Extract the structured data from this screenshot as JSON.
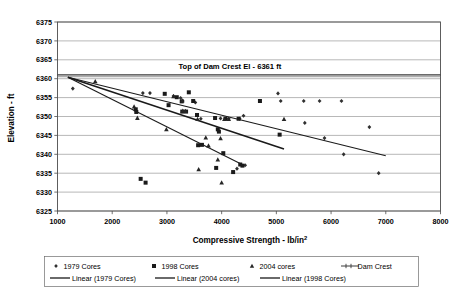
{
  "chart_data": {
    "type": "scatter",
    "title": "",
    "xlabel": "Compressive Strength - lb/in²",
    "ylabel": "Elevation - ft",
    "xlim": [
      1000,
      8000
    ],
    "ylim": [
      6325,
      6375
    ],
    "xticks": [
      1000,
      2000,
      3000,
      4000,
      5000,
      6000,
      7000,
      8000
    ],
    "yticks": [
      6325,
      6330,
      6335,
      6340,
      6345,
      6350,
      6355,
      6360,
      6365,
      6370,
      6375
    ],
    "xtick_labels": [
      "1000",
      "2000",
      "3000",
      "4000",
      "5000",
      "6000",
      "7000",
      "8000"
    ],
    "ytick_labels": [
      "6325",
      "6330",
      "6335",
      "6340",
      "6345",
      "6350",
      "6355",
      "6360",
      "6365",
      "6370",
      "6375"
    ],
    "grid": true,
    "grid_axis": "y",
    "legend_position": "bottom",
    "annotations": [
      {
        "name": "dam-crest-annotation",
        "text": "Top of Dam Crest El - 6361 ft",
        "x": 4150,
        "y": 6362.6
      }
    ],
    "series": [
      {
        "name": "1979 Cores",
        "marker": "diamond",
        "color": "#303030",
        "points": [
          [
            1280,
            6357.4
          ],
          [
            2560,
            6356.2
          ],
          [
            2690,
            6356.2
          ],
          [
            3120,
            6355.4
          ],
          [
            3250,
            6354.9
          ],
          [
            3290,
            6354.1
          ],
          [
            3520,
            6353.7
          ],
          [
            3620,
            6349.4
          ],
          [
            3980,
            6349.5
          ],
          [
            4080,
            6349.4
          ],
          [
            4130,
            6349.4
          ],
          [
            4330,
            6349.4
          ],
          [
            4400,
            6350.2
          ],
          [
            4280,
            6336.2
          ],
          [
            4430,
            6337.1
          ],
          [
            5030,
            6356.1
          ],
          [
            5080,
            6354.1
          ],
          [
            5500,
            6354.1
          ],
          [
            5520,
            6348.3
          ],
          [
            5790,
            6354.1
          ],
          [
            5880,
            6344.3
          ],
          [
            6190,
            6354.1
          ],
          [
            6230,
            6340.0
          ],
          [
            6700,
            6347.2
          ],
          [
            6870,
            6335.0
          ]
        ]
      },
      {
        "name": "1998 Cores",
        "marker": "square",
        "color": "#1a1a1a",
        "points": [
          [
            2430,
            6351.9
          ],
          [
            2440,
            6351.2
          ],
          [
            2520,
            6333.5
          ],
          [
            2610,
            6332.5
          ],
          [
            2960,
            6356.0
          ],
          [
            3030,
            6353.0
          ],
          [
            3180,
            6355.1
          ],
          [
            3270,
            6354.0
          ],
          [
            3280,
            6351.3
          ],
          [
            3350,
            6351.3
          ],
          [
            3400,
            6356.4
          ],
          [
            3480,
            6354.1
          ],
          [
            3550,
            6350.4
          ],
          [
            3570,
            6342.4
          ],
          [
            3640,
            6342.5
          ],
          [
            3880,
            6349.6
          ],
          [
            3900,
            6336.4
          ],
          [
            3930,
            6346.6
          ],
          [
            3950,
            6346.0
          ],
          [
            4030,
            6340.3
          ],
          [
            4070,
            6349.4
          ],
          [
            4210,
            6335.3
          ],
          [
            4310,
            6349.4
          ],
          [
            4340,
            6337.3
          ],
          [
            4380,
            6337.0
          ],
          [
            4700,
            6354.1
          ],
          [
            5060,
            6345.2
          ]
        ]
      },
      {
        "name": "2004 cores",
        "marker": "triangle",
        "color": "#262626",
        "points": [
          [
            1690,
            6359.3
          ],
          [
            2400,
            6352.6
          ],
          [
            2460,
            6349.6
          ],
          [
            2990,
            6346.6
          ],
          [
            3120,
            6355.3
          ],
          [
            3280,
            6354.2
          ],
          [
            3290,
            6351.5
          ],
          [
            3340,
            6351.4
          ],
          [
            3560,
            6349.3
          ],
          [
            3580,
            6336.0
          ],
          [
            3710,
            6344.4
          ],
          [
            3760,
            6342.3
          ],
          [
            3930,
            6338.6
          ],
          [
            3980,
            6344.2
          ],
          [
            4000,
            6332.5
          ],
          [
            4050,
            6349.3
          ],
          [
            4130,
            6349.3
          ],
          [
            5140,
            6349.3
          ]
        ]
      }
    ],
    "trendlines": [
      {
        "name": "Linear (1979 Cores)",
        "x0": 1190,
        "y0": 6360.4,
        "x1": 7000,
        "y1": 6339.6,
        "width": 1.1
      },
      {
        "name": "Linear (2004 cores)",
        "x0": 1190,
        "y0": 6360.4,
        "x1": 5140,
        "y1": 6341.4,
        "width": 1.6
      },
      {
        "name": "Linear (1998 Cores)",
        "x0": 1190,
        "y0": 6360.4,
        "x1": 4420,
        "y1": 6337.0,
        "width": 1.1
      }
    ],
    "crest_line": {
      "name": "Dam Crest",
      "value": 6361,
      "x0": 1000,
      "x1": 8000
    }
  },
  "legend": {
    "row1": [
      {
        "label": "1979 Cores",
        "marker": "diamond"
      },
      {
        "label": "1998 Cores",
        "marker": "square"
      },
      {
        "label": "2004 cores",
        "marker": "triangle"
      },
      {
        "label": "Dam Crest",
        "marker": "line-dash"
      }
    ],
    "row2": [
      {
        "label": "Linear (1979 Cores)",
        "marker": "line"
      },
      {
        "label": "Linear (2004 cores)",
        "marker": "line"
      },
      {
        "label": "Linear (1998 Cores)",
        "marker": "line"
      }
    ]
  }
}
